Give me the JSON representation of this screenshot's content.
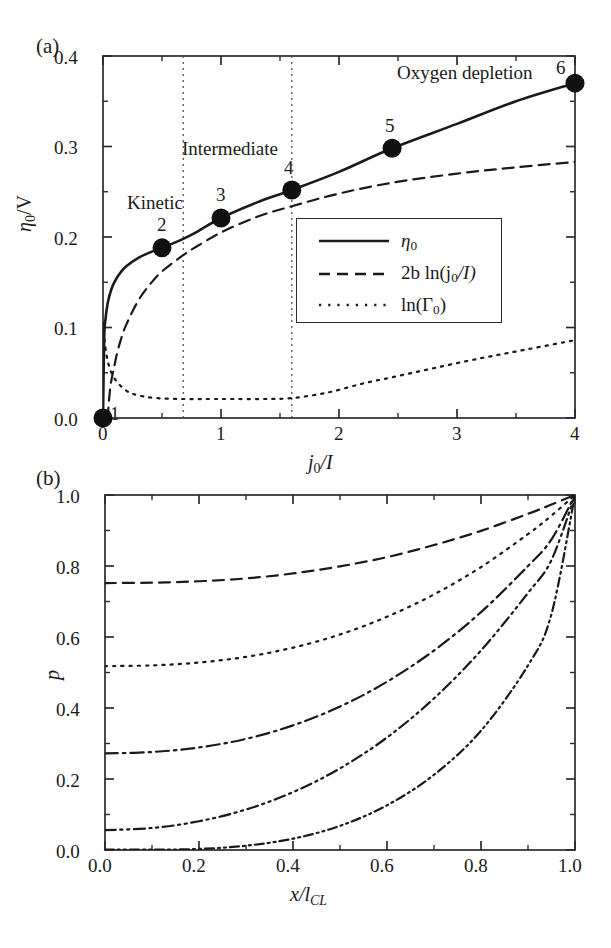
{
  "figure": {
    "panel_a_tag": "(a)",
    "panel_b_tag": "(b)"
  },
  "panel_a": {
    "ylabel_main": "η",
    "ylabel_sub": "0",
    "ylabel_unit": "/V",
    "xlabel_main": "j",
    "xlabel_sub": "0",
    "xlabel_denom": "/I",
    "yticks": [
      "0.0",
      "0.1",
      "0.2",
      "0.3",
      "0.4"
    ],
    "xticks": [
      "0",
      "1",
      "2",
      "3",
      "4"
    ],
    "annotations": [
      {
        "text": "Kinetic",
        "x": 0.3,
        "y": 0.238
      },
      {
        "text": "Intermediate",
        "x": 1.13,
        "y": 0.3
      },
      {
        "text": "Oxygen depletion",
        "x": 3.3,
        "y": 0.382
      }
    ],
    "point_labels": [
      "1",
      "2",
      "3",
      "4",
      "5",
      "6"
    ],
    "region_dividers": [
      0.68,
      1.6
    ],
    "legend": {
      "entries": [
        {
          "style": "solid",
          "label_main": "η",
          "label_sub": "0",
          "label_tail": ""
        },
        {
          "style": "dashed",
          "label_main": "2b ln(j",
          "label_sub": "0",
          "label_tail": "/I)"
        },
        {
          "style": "dotted",
          "label_main": "ln(Γ",
          "label_sub": "0",
          "label_tail": ")"
        }
      ]
    }
  },
  "panel_b": {
    "ylabel": "p",
    "xlabel_main": "x/l",
    "xlabel_sub": "CL",
    "yticks": [
      "0.0",
      "0.2",
      "0.4",
      "0.6",
      "0.8",
      "1.0"
    ],
    "xticks": [
      "0.0",
      "0.2",
      "0.4",
      "0.6",
      "0.8",
      "1.0"
    ]
  },
  "chart_data": [
    {
      "type": "line",
      "panel": "(a)",
      "title": "",
      "xlabel": "j0/I",
      "ylabel": "eta0/V",
      "xlim": [
        0,
        4
      ],
      "ylim": [
        0.0,
        0.4
      ],
      "grid": false,
      "legend_position": "center-right-inside",
      "annotations": [
        "Kinetic",
        "Intermediate",
        "Oxygen depletion"
      ],
      "vertical_dotted_lines": [
        0.68,
        1.6
      ],
      "series": [
        {
          "name": "eta_0",
          "style": "solid",
          "x": [
            0.0,
            0.01,
            0.02,
            0.04,
            0.07,
            0.1,
            0.15,
            0.2,
            0.3,
            0.4,
            0.5,
            0.68,
            0.8,
            1.0,
            1.3,
            1.6,
            2.0,
            2.45,
            3.0,
            3.5,
            4.0
          ],
          "y": [
            0.0,
            0.088,
            0.108,
            0.127,
            0.142,
            0.151,
            0.161,
            0.168,
            0.177,
            0.183,
            0.188,
            0.198,
            0.206,
            0.221,
            0.238,
            0.252,
            0.272,
            0.298,
            0.325,
            0.35,
            0.37
          ]
        },
        {
          "name": "2b ln(j_0/I)",
          "style": "dashed",
          "x": [
            0.0,
            0.05,
            0.1,
            0.15,
            0.2,
            0.3,
            0.4,
            0.5,
            0.68,
            0.8,
            1.0,
            1.3,
            1.6,
            2.0,
            2.45,
            3.0,
            3.5,
            4.0
          ],
          "y": [
            -0.1,
            0.018,
            0.06,
            0.086,
            0.104,
            0.13,
            0.148,
            0.162,
            0.18,
            0.19,
            0.205,
            0.222,
            0.234,
            0.248,
            0.26,
            0.27,
            0.277,
            0.283
          ]
        },
        {
          "name": "ln(Gamma_0)",
          "style": "dotted",
          "x": [
            0.0,
            0.02,
            0.05,
            0.1,
            0.2,
            0.3,
            0.45,
            0.68,
            0.9,
            1.1,
            1.35,
            1.6,
            1.9,
            2.2,
            2.45,
            2.8,
            3.2,
            3.6,
            4.0
          ],
          "y": [
            0.105,
            0.078,
            0.058,
            0.043,
            0.03,
            0.025,
            0.022,
            0.021,
            0.021,
            0.021,
            0.021,
            0.022,
            0.028,
            0.038,
            0.045,
            0.055,
            0.066,
            0.076,
            0.086
          ]
        }
      ],
      "markers": [
        {
          "label": "1",
          "x": 0.0,
          "y": 0.0
        },
        {
          "label": "2",
          "x": 0.5,
          "y": 0.188
        },
        {
          "label": "3",
          "x": 1.0,
          "y": 0.221
        },
        {
          "label": "4",
          "x": 1.6,
          "y": 0.252
        },
        {
          "label": "5",
          "x": 2.45,
          "y": 0.298
        },
        {
          "label": "6",
          "x": 4.0,
          "y": 0.37
        }
      ]
    },
    {
      "type": "line",
      "panel": "(b)",
      "title": "",
      "xlabel": "x/l_CL",
      "ylabel": "p",
      "xlim": [
        0.0,
        1.0
      ],
      "ylim": [
        0.0,
        1.0
      ],
      "grid": false,
      "legend_position": "none",
      "series": [
        {
          "name": "curve-1",
          "style": "dashed",
          "x": [
            0.0,
            0.1,
            0.2,
            0.3,
            0.4,
            0.5,
            0.6,
            0.7,
            0.8,
            0.9,
            0.95,
            1.0
          ],
          "y": [
            0.752,
            0.753,
            0.757,
            0.765,
            0.779,
            0.799,
            0.825,
            0.859,
            0.899,
            0.947,
            0.973,
            1.0
          ]
        },
        {
          "name": "curve-2",
          "style": "dotted",
          "x": [
            0.0,
            0.1,
            0.2,
            0.3,
            0.4,
            0.5,
            0.6,
            0.7,
            0.8,
            0.9,
            0.95,
            1.0
          ],
          "y": [
            0.518,
            0.52,
            0.528,
            0.544,
            0.57,
            0.607,
            0.657,
            0.72,
            0.797,
            0.89,
            0.942,
            1.0
          ]
        },
        {
          "name": "curve-3",
          "style": "dash-dot",
          "x": [
            0.0,
            0.1,
            0.2,
            0.3,
            0.4,
            0.5,
            0.6,
            0.7,
            0.8,
            0.9,
            0.95,
            1.0
          ],
          "y": [
            0.272,
            0.276,
            0.289,
            0.313,
            0.351,
            0.404,
            0.474,
            0.562,
            0.67,
            0.8,
            0.875,
            1.0
          ]
        },
        {
          "name": "curve-4",
          "style": "dash-dot-dot",
          "x": [
            0.0,
            0.1,
            0.2,
            0.3,
            0.4,
            0.5,
            0.6,
            0.7,
            0.8,
            0.9,
            0.95,
            1.0
          ],
          "y": [
            0.056,
            0.062,
            0.081,
            0.114,
            0.163,
            0.23,
            0.317,
            0.427,
            0.562,
            0.724,
            0.817,
            1.0
          ]
        },
        {
          "name": "curve-5",
          "style": "dash-dot-dot-fine",
          "x": [
            0.0,
            0.1,
            0.2,
            0.3,
            0.4,
            0.5,
            0.6,
            0.7,
            0.8,
            0.9,
            0.95,
            1.0
          ],
          "y": [
            0.001,
            0.001,
            0.003,
            0.012,
            0.032,
            0.068,
            0.126,
            0.212,
            0.336,
            0.52,
            0.665,
            1.0
          ]
        }
      ]
    }
  ]
}
